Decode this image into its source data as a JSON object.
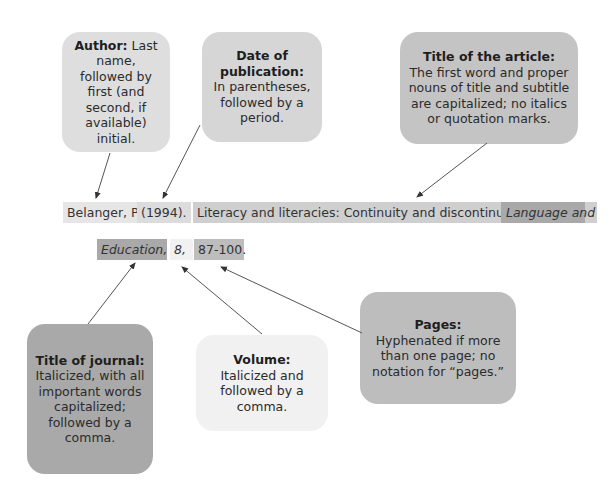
{
  "colors": {
    "author": "#dedede",
    "date": "#d6d6d6",
    "article": "#c4c4c4",
    "journal": "#a9a9a9",
    "volume": "#f1f1f1",
    "pages": "#bdbdbd",
    "arrow": "#555555"
  },
  "callouts": {
    "author": {
      "title": "Author:",
      "text": "Last name, followed by first (and second, if available) initial."
    },
    "date": {
      "title": "Date of publication:",
      "text": "In parentheses, followed by a period."
    },
    "article": {
      "title": "Title of the article:",
      "text": "The first word and proper nouns of title and subtitle are capitalized; no italics or quotation marks."
    },
    "journal": {
      "title": "Title of journal:",
      "text": "Italicized, with all important words capitalized; followed by a comma."
    },
    "volume": {
      "title": "Volume:",
      "text": "Italicized and followed by a comma."
    },
    "pages": {
      "title": "Pages:",
      "text": "Hyphenated if more than one page; no notation for “pages.”"
    }
  },
  "citation": {
    "author": "Belanger, P.",
    "year": "(1994).",
    "article_title": "Literacy and literacies: Continuity and discontinuity.",
    "journal_part1": "Language and",
    "journal_part2": "Education,",
    "volume": "8,",
    "pages": "87-100."
  }
}
